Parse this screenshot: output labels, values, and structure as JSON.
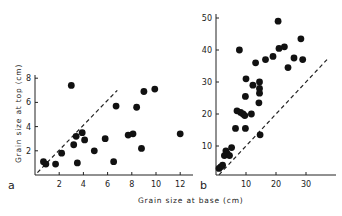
{
  "chart_data": [
    {
      "type": "scatter",
      "panel": "a",
      "xlabel": "Grain size at base (cm)",
      "ylabel": "Grain size at top (cm)",
      "xlim": [
        0,
        12.5
      ],
      "ylim": [
        0,
        8.5
      ],
      "xticks": [
        2,
        4,
        6,
        8,
        10,
        12
      ],
      "yticks": [
        2,
        4,
        6,
        8
      ],
      "grid": false,
      "reference_line": {
        "style": "dashed",
        "from": [
          0.2,
          0.2
        ],
        "to": [
          6.8,
          7.0
        ]
      },
      "points": [
        {
          "x": 0.7,
          "y": 1.1
        },
        {
          "x": 0.9,
          "y": 0.9
        },
        {
          "x": 1.7,
          "y": 0.9
        },
        {
          "x": 2.2,
          "y": 1.8
        },
        {
          "x": 3.0,
          "y": 7.4
        },
        {
          "x": 3.2,
          "y": 2.5
        },
        {
          "x": 3.4,
          "y": 3.2
        },
        {
          "x": 3.5,
          "y": 1.0
        },
        {
          "x": 3.9,
          "y": 3.5
        },
        {
          "x": 4.1,
          "y": 2.9
        },
        {
          "x": 4.9,
          "y": 2.0
        },
        {
          "x": 5.8,
          "y": 3.0
        },
        {
          "x": 6.5,
          "y": 1.1
        },
        {
          "x": 6.7,
          "y": 5.7
        },
        {
          "x": 7.7,
          "y": 3.3
        },
        {
          "x": 8.1,
          "y": 3.4
        },
        {
          "x": 8.4,
          "y": 5.6
        },
        {
          "x": 8.8,
          "y": 2.2
        },
        {
          "x": 9.0,
          "y": 6.9
        },
        {
          "x": 9.9,
          "y": 7.1
        },
        {
          "x": 12.0,
          "y": 3.4
        }
      ]
    },
    {
      "type": "scatter",
      "panel": "b",
      "xlabel": "Grain size at base (cm)",
      "ylabel": "",
      "xlim": [
        0,
        39
      ],
      "ylim": [
        0,
        53
      ],
      "xticks": [
        10,
        20,
        30
      ],
      "yticks": [
        10,
        20,
        30,
        40,
        50
      ],
      "grid": false,
      "reference_line": {
        "style": "dashed",
        "from": [
          1,
          1
        ],
        "to": [
          37,
          37
        ]
      },
      "points": [
        {
          "x": 1.0,
          "y": 3.0
        },
        {
          "x": 1.6,
          "y": 3.5
        },
        {
          "x": 2.2,
          "y": 4.0
        },
        {
          "x": 2.8,
          "y": 7.0
        },
        {
          "x": 3.3,
          "y": 8.5
        },
        {
          "x": 3.8,
          "y": 7.5
        },
        {
          "x": 4.5,
          "y": 7.0
        },
        {
          "x": 5.2,
          "y": 9.5
        },
        {
          "x": 6.5,
          "y": 15.5
        },
        {
          "x": 7.0,
          "y": 21.0
        },
        {
          "x": 7.8,
          "y": 40.0
        },
        {
          "x": 8.2,
          "y": 20.5
        },
        {
          "x": 9.0,
          "y": 20.0
        },
        {
          "x": 9.6,
          "y": 19.5
        },
        {
          "x": 9.8,
          "y": 25.5
        },
        {
          "x": 10.0,
          "y": 31.0
        },
        {
          "x": 9.8,
          "y": 15.5
        },
        {
          "x": 11.8,
          "y": 20.0
        },
        {
          "x": 12.3,
          "y": 29.0
        },
        {
          "x": 13.2,
          "y": 36.0
        },
        {
          "x": 14.5,
          "y": 30.0
        },
        {
          "x": 14.5,
          "y": 28.0
        },
        {
          "x": 14.5,
          "y": 26.5
        },
        {
          "x": 14.3,
          "y": 23.5
        },
        {
          "x": 14.7,
          "y": 13.5
        },
        {
          "x": 16.5,
          "y": 37.0
        },
        {
          "x": 19.0,
          "y": 38.0
        },
        {
          "x": 20.7,
          "y": 49.0
        },
        {
          "x": 21.0,
          "y": 40.5
        },
        {
          "x": 22.8,
          "y": 41.0
        },
        {
          "x": 24.0,
          "y": 34.5
        },
        {
          "x": 26.0,
          "y": 37.5
        },
        {
          "x": 28.3,
          "y": 43.5
        },
        {
          "x": 28.9,
          "y": 37.0
        }
      ]
    }
  ],
  "labels": {
    "panel_a": "a",
    "panel_b": "b",
    "x_axis_title": "Grain size at base (cm)",
    "y_axis_title": "Grain size at top (cm)"
  },
  "colors": {
    "points": "#111111",
    "axes": "#222222",
    "background": "#ffffff"
  }
}
